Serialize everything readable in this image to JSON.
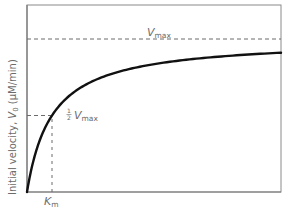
{
  "chart_data": {
    "type": "line",
    "title": "",
    "model": "Michaelis-Menten",
    "xlabel": "",
    "ylabel": "Initial velocity, V0 (μM/min)",
    "ylabel_parts": {
      "prefix": "Initial velocity, ",
      "symbol": "V",
      "subscript": "0",
      "units": " (μM/min)"
    },
    "Km": 1,
    "Vmax": 1,
    "xlim": [
      0,
      10.16
    ],
    "ylim": [
      0,
      1.2
    ],
    "grid": false,
    "series": [
      {
        "name": "reaction velocity",
        "equation": "v = Vmax*S/(Km+S)",
        "samples": 120
      }
    ],
    "reference_lines": [
      {
        "name": "vmax-line",
        "orientation": "horizontal",
        "value": 1,
        "style": "dashed"
      },
      {
        "name": "half-vmax-line",
        "orientation": "horizontal",
        "value": 0.5,
        "xmax": 1,
        "style": "dashed"
      },
      {
        "name": "km-line",
        "orientation": "vertical",
        "value": 1,
        "ymax": 0.5,
        "style": "dashed"
      }
    ],
    "annotations": {
      "vmax": {
        "symbol": "V",
        "subscript": "max"
      },
      "half_vmax": {
        "fraction_num": "1",
        "fraction_den": "2",
        "symbol": "V",
        "subscript": "max"
      },
      "km": {
        "symbol": "K",
        "subscript": "m"
      }
    }
  }
}
